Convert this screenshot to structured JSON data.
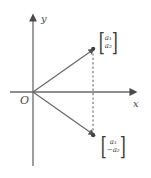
{
  "figure": {
    "type": "vector-reflection-diagram",
    "background_color": "#ffffff",
    "stroke_color": "#585858",
    "text_color": "#3a3a3a"
  },
  "axes": {
    "x_label": "x",
    "y_label": "y",
    "origin_label": "O",
    "x_axis_name": "horizontal-axis",
    "y_axis_name": "vertical-axis"
  },
  "vectors": [
    {
      "name": "vector-a",
      "direction": "up-right",
      "components": {
        "first": "a",
        "first_sub": "1",
        "second": "a",
        "second_sub": "2",
        "second_sign": ""
      },
      "label_first": "a₁",
      "label_second": "a₂",
      "tip_x": 93,
      "tip_y": 49
    },
    {
      "name": "vector-a-reflected",
      "direction": "down-right",
      "components": {
        "first": "a",
        "first_sub": "1",
        "second": "a",
        "second_sub": "2",
        "second_sign": "−"
      },
      "label_first": "a₁",
      "label_second": "−a₂",
      "tip_x": 93,
      "tip_y": 135
    }
  ],
  "connector": {
    "name": "reflection-dashed-line",
    "style": "dashed"
  }
}
